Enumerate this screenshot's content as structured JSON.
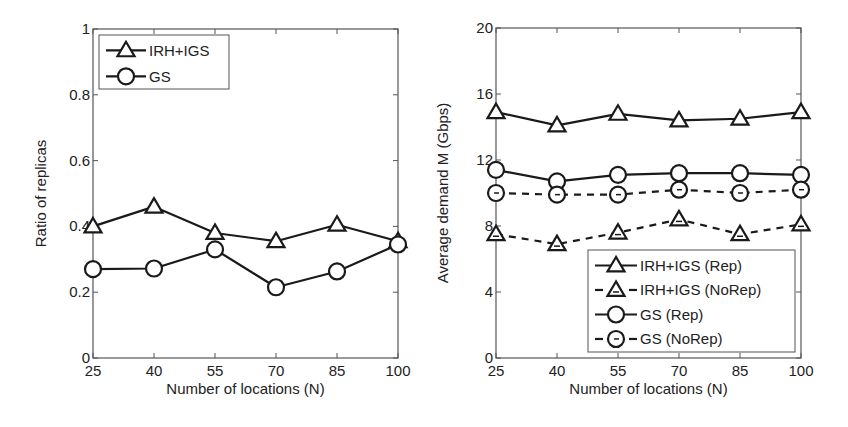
{
  "chart_data": [
    {
      "type": "line",
      "title": "",
      "xlabel": "Number of locations (N)",
      "ylabel": "Ratio of replicas",
      "x": [
        25,
        40,
        55,
        70,
        85,
        100
      ],
      "xticks": [
        "25",
        "40",
        "55",
        "70",
        "85",
        "100"
      ],
      "yticks": [
        "0",
        "0.2",
        "0.4",
        "0.6",
        "0.8",
        "1"
      ],
      "ytick_values": [
        0,
        0.2,
        0.4,
        0.6,
        0.8,
        1
      ],
      "xlim": [
        25,
        100
      ],
      "ylim": [
        0,
        1
      ],
      "grid": false,
      "legend_position": "upper left",
      "series": [
        {
          "name": "IRH+IGS",
          "marker": "triangle",
          "linestyle": "solid",
          "values": [
            0.4,
            0.46,
            0.38,
            0.355,
            0.405,
            0.355
          ]
        },
        {
          "name": "GS",
          "marker": "circle",
          "linestyle": "solid",
          "values": [
            0.27,
            0.272,
            0.33,
            0.215,
            0.263,
            0.345
          ]
        }
      ]
    },
    {
      "type": "line",
      "title": "",
      "xlabel": "Number of locations (N)",
      "ylabel": "Average demand M (Gbps)",
      "x": [
        25,
        40,
        55,
        70,
        85,
        100
      ],
      "xticks": [
        "25",
        "40",
        "55",
        "70",
        "85",
        "100"
      ],
      "yticks": [
        "0",
        "4",
        "8",
        "12",
        "16",
        "20"
      ],
      "ytick_values": [
        0,
        4,
        8,
        12,
        16,
        20
      ],
      "xlim": [
        25,
        100
      ],
      "ylim": [
        0,
        20
      ],
      "grid": false,
      "legend_position": "lower right",
      "series": [
        {
          "name": "IRH+IGS (Rep)",
          "marker": "triangle",
          "linestyle": "solid",
          "values": [
            14.9,
            14.1,
            14.8,
            14.4,
            14.5,
            14.9
          ]
        },
        {
          "name": "IRH+IGS (NoRep)",
          "marker": "triangle",
          "linestyle": "dashed",
          "values": [
            7.5,
            6.9,
            7.6,
            8.4,
            7.5,
            8.1
          ]
        },
        {
          "name": "GS (Rep)",
          "marker": "circle",
          "linestyle": "solid",
          "values": [
            11.4,
            10.7,
            11.1,
            11.2,
            11.2,
            11.1
          ]
        },
        {
          "name": "GS (NoRep)",
          "marker": "circle",
          "linestyle": "dashed",
          "values": [
            10.0,
            9.9,
            9.9,
            10.2,
            10.0,
            10.2
          ]
        }
      ]
    }
  ],
  "colors": {
    "line": "#1a1a1a",
    "axis": "#555555",
    "text": "#222222",
    "background": "#ffffff"
  }
}
